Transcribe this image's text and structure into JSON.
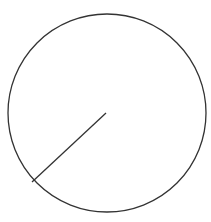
{
  "diagram": {
    "type": "circle-with-radius",
    "background": "#ffffff",
    "stroke_color": "#333333",
    "circle": {
      "cx": 107,
      "cy": 113,
      "r": 99
    },
    "radius_line": {
      "x1": 106,
      "y1": 113,
      "x2": 32,
      "y2": 182
    },
    "labels": []
  }
}
